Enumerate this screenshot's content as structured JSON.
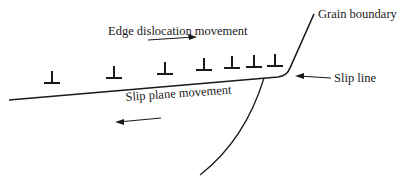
{
  "diagram": {
    "labels": {
      "edge_dislocation_movement": "Edge dislocation movement",
      "grain_boundary": "Grain boundary",
      "slip_line": "Slip line",
      "slip_plane_movement": "Slip plane movement"
    },
    "dislocation_symbol": "⊥",
    "dislocation_count": 7,
    "colors": {
      "line": "#1a1a1a",
      "background": "#ffffff"
    }
  }
}
